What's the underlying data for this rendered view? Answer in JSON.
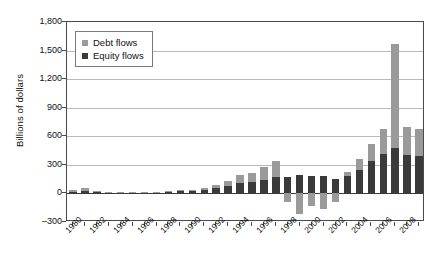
{
  "chart_data": {
    "type": "bar",
    "subtype": "stacked-bar",
    "title": "",
    "xlabel": "",
    "ylabel": "Billions of dollars",
    "ylim": [
      -300,
      1800
    ],
    "ytick_values": [
      1800,
      1500,
      1200,
      900,
      600,
      300,
      0,
      -300
    ],
    "ytick_labels": [
      "1,800",
      "1,500",
      "1,200",
      "900",
      "600",
      "300",
      "0",
      "–300"
    ],
    "grid": "horizontal",
    "legend_position": "top-left-inside",
    "categories": [
      "1980",
      "1981",
      "1982",
      "1983",
      "1984",
      "1985",
      "1986",
      "1987",
      "1988",
      "1989",
      "1990",
      "1991",
      "1992",
      "1993",
      "1994",
      "1995",
      "1996",
      "1997",
      "1998",
      "1999",
      "2000",
      "2001",
      "2002",
      "2003",
      "2004",
      "2005",
      "2006",
      "2007",
      "2008",
      "2009"
    ],
    "xtick_labels_shown": [
      "1980",
      "1982",
      "1984",
      "1986",
      "1988",
      "1990",
      "1992",
      "1994",
      "1996",
      "1998",
      "2000",
      "2002",
      "2004",
      "2006",
      "2008"
    ],
    "series": [
      {
        "name": "Equity flows",
        "color": "#3a3a3a",
        "values": [
          20,
          30,
          18,
          10,
          8,
          8,
          10,
          12,
          18,
          22,
          28,
          35,
          55,
          80,
          110,
          120,
          145,
          175,
          175,
          195,
          185,
          180,
          155,
          180,
          250,
          340,
          415,
          475,
          400,
          390
        ]
      },
      {
        "name": "Debt flows",
        "color": "#9a9a9a",
        "values": [
          15,
          25,
          12,
          6,
          4,
          4,
          5,
          6,
          8,
          10,
          12,
          18,
          35,
          55,
          80,
          95,
          130,
          165,
          -95,
          -215,
          -130,
          -165,
          -95,
          45,
          110,
          180,
          265,
          1095,
          300,
          290
        ]
      }
    ],
    "series_stack_order": [
      "Equity flows",
      "Debt flows"
    ],
    "peak_annotation": {
      "year": "2007",
      "total": 1570
    }
  },
  "legend": {
    "items": [
      {
        "label": "Debt flows",
        "color": "#9a9a9a"
      },
      {
        "label": "Equity flows",
        "color": "#3a3a3a"
      }
    ]
  }
}
